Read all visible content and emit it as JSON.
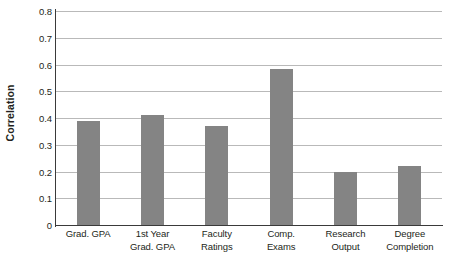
{
  "chart_data": {
    "type": "bar",
    "title": "",
    "subtitle": "",
    "xlabel": "",
    "ylabel": "Correlation",
    "ylim": [
      0,
      0.8
    ],
    "ytick_step": 0.1,
    "grid": true,
    "legend": "none",
    "bar_color": "#848484",
    "axis_color": "#3a3a3a",
    "gridline_color": "#b9b9b9",
    "text_color": "#231f20",
    "categories": [
      "Grad. GPA",
      "1st Year Grad. GPA",
      "Faculty Ratings",
      "Comp. Exams",
      "Research Output",
      "Degree Completion"
    ],
    "category_lines": [
      [
        "Grad. GPA",
        ""
      ],
      [
        "1st Year",
        "Grad. GPA"
      ],
      [
        "Faculty",
        "Ratings"
      ],
      [
        "Comp.",
        "Exams"
      ],
      [
        "Research",
        "Output"
      ],
      [
        "Degree",
        "Completion"
      ]
    ],
    "values": [
      0.39,
      0.41,
      0.37,
      0.585,
      0.2,
      0.22
    ],
    "ytick_labels": [
      "0.8",
      "0.7",
      "0.6",
      "0.5",
      "0.4",
      "0.3",
      "0.2",
      "0.1",
      "0"
    ],
    "ytick_values": [
      0.8,
      0.7,
      0.6,
      0.5,
      0.4,
      0.3,
      0.2,
      0.1,
      0
    ]
  }
}
